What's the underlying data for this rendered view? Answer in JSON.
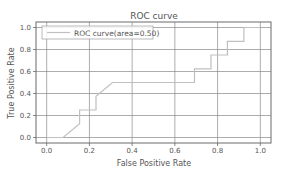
{
  "chart_data": {
    "type": "line",
    "title": "ROC curve",
    "xlabel": "False Positive Rate",
    "ylabel": "True Positive Rate",
    "xlim": [
      -0.05,
      1.05
    ],
    "ylim": [
      -0.05,
      1.05
    ],
    "xticks": [
      "0.0",
      "0.2",
      "0.4",
      "0.6",
      "0.8",
      "1.0"
    ],
    "yticks": [
      "0.0",
      "0.2",
      "0.4",
      "0.6",
      "0.8",
      "1.0"
    ],
    "grid": true,
    "legend_position": "upper left",
    "series": [
      {
        "name": "ROC curve(area=0.50)",
        "color": "#c0c0c0",
        "x": [
          0.0,
          0.077,
          0.154,
          0.154,
          0.231,
          0.231,
          0.308,
          0.692,
          0.692,
          0.769,
          0.769,
          0.846,
          0.846,
          0.923,
          0.923,
          1.0
        ],
        "y": [
          0.0,
          0.0,
          0.125,
          0.25,
          0.25,
          0.375,
          0.5,
          0.5,
          0.625,
          0.625,
          0.75,
          0.75,
          0.875,
          0.875,
          1.0,
          1.0
        ]
      }
    ]
  },
  "legend": {
    "label": "ROC curve(area=0.50)"
  }
}
